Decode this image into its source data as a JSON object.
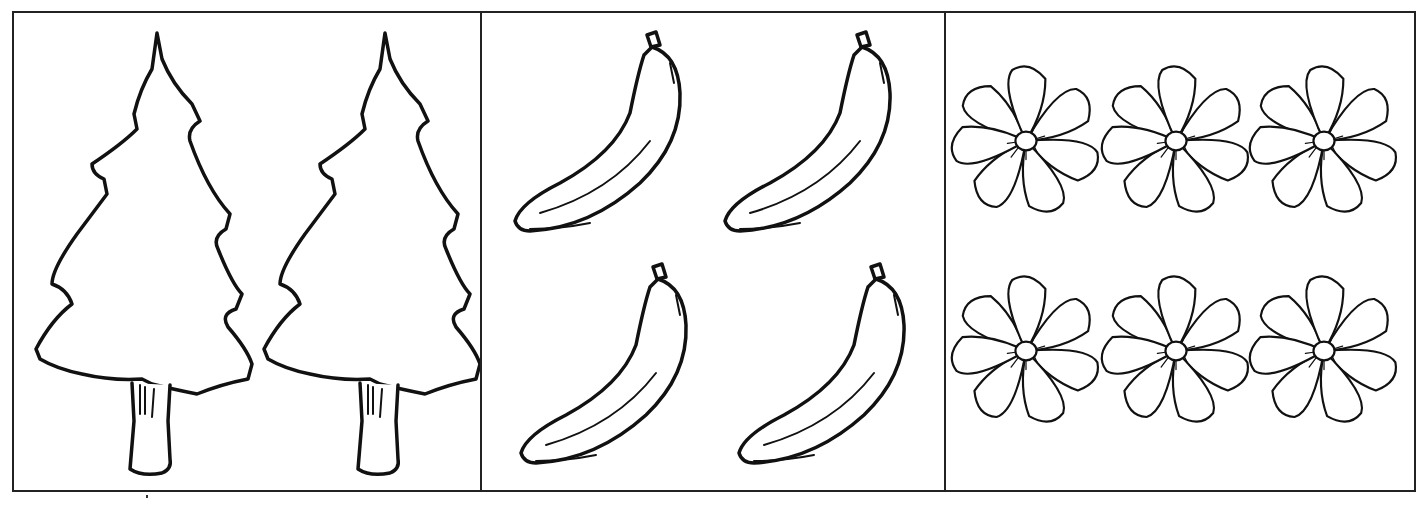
{
  "worksheet": {
    "panels": [
      {
        "id": "trees",
        "item": "tree-icon",
        "count": 2,
        "label": ""
      },
      {
        "id": "bananas",
        "item": "banana-icon",
        "count": 4,
        "label": ""
      },
      {
        "id": "flowers",
        "item": "flower-icon",
        "count": 6,
        "label": ""
      }
    ],
    "colors": {
      "stroke": "#111111",
      "background": "#ffffff",
      "border": "#222222"
    }
  }
}
